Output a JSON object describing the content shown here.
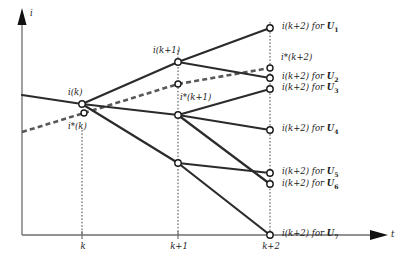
{
  "figure": {
    "axes": {
      "y_label": "i",
      "x_label": "t",
      "x_ticks": [
        {
          "label": "k",
          "x": 82
        },
        {
          "label": "k+1",
          "x": 178
        },
        {
          "label": "k+2",
          "x": 270
        }
      ]
    },
    "colors": {
      "solid_line": "#2b2b2b",
      "dashed_line": "#585858",
      "axis": "#6e6e6e",
      "node_fill": "#ffffff",
      "node_stroke": "#1a1a1a",
      "text": "#1a1a1a"
    },
    "node_labels": [
      {
        "name": "i-k-label",
        "text": "i(k)",
        "x": 68,
        "y": 88
      },
      {
        "name": "i-star-k-label",
        "text": "i*(k)",
        "x": 68,
        "y": 122
      },
      {
        "name": "i-k1-label",
        "text": "i(k+1)",
        "x": 153,
        "y": 46
      },
      {
        "name": "i-star-k1-label",
        "text": "i*(k+1)",
        "x": 180,
        "y": 93
      },
      {
        "name": "i-star-k2-label",
        "text": "i*(k+2)",
        "x": 281,
        "y": 53
      }
    ],
    "leaf_labels": [
      {
        "name": "leaf-label-u1",
        "main": "i(k+2) for ",
        "bold": "U",
        "sub": "1",
        "x": 282,
        "y": 22
      },
      {
        "name": "leaf-label-u2",
        "main": "i(k+2) for ",
        "bold": "U",
        "sub": "2",
        "x": 282,
        "y": 72
      },
      {
        "name": "leaf-label-u3",
        "main": "i(k+2) for ",
        "bold": "U",
        "sub": "3",
        "x": 282,
        "y": 83
      },
      {
        "name": "leaf-label-u4",
        "main": "i(k+2) for ",
        "bold": "U",
        "sub": "4",
        "x": 282,
        "y": 124
      },
      {
        "name": "leaf-label-u5",
        "main": "i(k+2) for ",
        "bold": "U",
        "sub": "5",
        "x": 282,
        "y": 167
      },
      {
        "name": "leaf-label-u6",
        "main": "i(k+2) for ",
        "bold": "U",
        "sub": "6",
        "x": 282,
        "y": 179
      },
      {
        "name": "leaf-label-u7",
        "main": "i(k+2) for ",
        "bold": "U",
        "sub": "7",
        "x": 282,
        "y": 229
      }
    ],
    "nodes": [
      {
        "name": "node-i-k",
        "x": 82,
        "y": 104,
        "r": 3.2
      },
      {
        "name": "node-i-star-k",
        "x": 84,
        "y": 113,
        "r": 3.0
      },
      {
        "name": "node-i-k1-top",
        "x": 178,
        "y": 62,
        "r": 3.2
      },
      {
        "name": "node-i-star-k1",
        "x": 178,
        "y": 84,
        "r": 3.0
      },
      {
        "name": "node-k1-mid",
        "x": 178,
        "y": 115,
        "r": 3.2
      },
      {
        "name": "node-k1-low",
        "x": 178,
        "y": 163,
        "r": 3.2
      },
      {
        "name": "node-u1",
        "x": 270,
        "y": 28,
        "r": 3.2
      },
      {
        "name": "node-i-star-k2",
        "x": 270,
        "y": 68,
        "r": 3.0
      },
      {
        "name": "node-u2",
        "x": 270,
        "y": 78,
        "r": 3.2
      },
      {
        "name": "node-u3",
        "x": 270,
        "y": 89,
        "r": 3.2
      },
      {
        "name": "node-u4",
        "x": 270,
        "y": 130,
        "r": 3.2
      },
      {
        "name": "node-u5",
        "x": 270,
        "y": 173,
        "r": 3.2
      },
      {
        "name": "node-u6",
        "x": 270,
        "y": 184,
        "r": 3.2
      },
      {
        "name": "node-u7",
        "x": 270,
        "y": 235,
        "r": 3.2
      }
    ],
    "solid_edges": [
      {
        "name": "edge-history-to-ik",
        "x1": 22,
        "y1": 95,
        "x2": 82,
        "y2": 104
      },
      {
        "name": "edge-ik-to-k1top",
        "x1": 82,
        "y1": 104,
        "x2": 178,
        "y2": 62
      },
      {
        "name": "edge-ik-to-k1mid",
        "x1": 82,
        "y1": 104,
        "x2": 178,
        "y2": 115
      },
      {
        "name": "edge-ik-to-k1low",
        "x1": 82,
        "y1": 104,
        "x2": 178,
        "y2": 163
      },
      {
        "name": "edge-k1top-to-u1",
        "x1": 178,
        "y1": 62,
        "x2": 270,
        "y2": 28
      },
      {
        "name": "edge-k1top-to-u2",
        "x1": 178,
        "y1": 62,
        "x2": 270,
        "y2": 78
      },
      {
        "name": "edge-k1mid-to-u3",
        "x1": 178,
        "y1": 115,
        "x2": 270,
        "y2": 89
      },
      {
        "name": "edge-k1mid-to-u4",
        "x1": 178,
        "y1": 115,
        "x2": 270,
        "y2": 130
      },
      {
        "name": "edge-k1mid-to-u6",
        "x1": 178,
        "y1": 115,
        "x2": 270,
        "y2": 184
      },
      {
        "name": "edge-k1low-to-u5",
        "x1": 178,
        "y1": 163,
        "x2": 270,
        "y2": 173
      },
      {
        "name": "edge-k1low-to-u7",
        "x1": 178,
        "y1": 163,
        "x2": 270,
        "y2": 235
      }
    ],
    "dashed_edges": [
      {
        "name": "edge-dashed-history",
        "x1": 22,
        "y1": 132,
        "x2": 84,
        "y2": 113
      },
      {
        "name": "edge-dashed-k-to-k1",
        "x1": 84,
        "y1": 113,
        "x2": 178,
        "y2": 84
      },
      {
        "name": "edge-dashed-k1-to-k2",
        "x1": 178,
        "y1": 84,
        "x2": 270,
        "y2": 68
      }
    ],
    "guides": [
      {
        "name": "guide-k",
        "x": 82,
        "y1": 130,
        "y2": 235
      },
      {
        "name": "guide-k1",
        "x": 178,
        "y1": 50,
        "y2": 235
      },
      {
        "name": "guide-k2",
        "x": 270,
        "y1": 22,
        "y2": 235
      }
    ]
  }
}
